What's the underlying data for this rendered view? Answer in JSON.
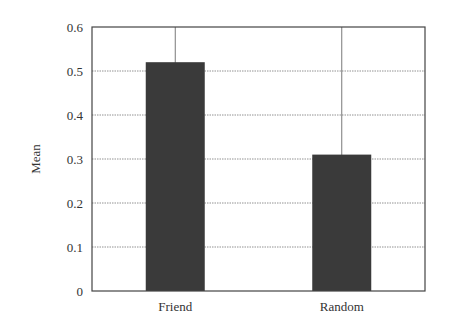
{
  "chart_data": {
    "type": "bar",
    "title": "",
    "xlabel": "",
    "ylabel": "Mean",
    "categories": [
      "Friend",
      "Random"
    ],
    "values": [
      0.52,
      0.31
    ],
    "ylim": [
      0,
      0.6
    ],
    "yticks": [
      "0",
      "0.1",
      "0.2",
      "0.3",
      "0.4",
      "0.5",
      "0.6"
    ],
    "grid": true,
    "legend": null,
    "bar_color": "#3a3a3a"
  }
}
